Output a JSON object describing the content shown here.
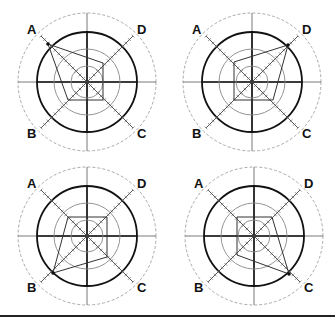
{
  "diagram": {
    "type": "radar-chart-grid",
    "layout": "2x2",
    "axis_labels": [
      "A",
      "D",
      "B",
      "C"
    ],
    "colors": {
      "line": "#111111",
      "ring": "#888888",
      "dashed": "#aaaaaa",
      "polygon": "#333333"
    },
    "panels": [
      {
        "id": "top-left",
        "center": [
          87,
          82
        ],
        "dominant_axis": "A",
        "vertices": {
          "A": [
            48,
            44
          ],
          "D": [
            103,
            63
          ],
          "C": [
            103,
            100
          ],
          "B": [
            68,
            100
          ]
        }
      },
      {
        "id": "top-right",
        "center": [
          252,
          82
        ],
        "dominant_axis": "D",
        "vertices": {
          "A": [
            234,
            62
          ],
          "D": [
            288,
            45
          ],
          "C": [
            273,
            100
          ],
          "B": [
            234,
            100
          ]
        }
      },
      {
        "id": "bottom-left",
        "center": [
          87,
          236
        ],
        "dominant_axis": "B",
        "vertices": {
          "A": [
            68,
            217
          ],
          "D": [
            107,
            217
          ],
          "C": [
            107,
            257
          ],
          "B": [
            53,
            273
          ]
        }
      },
      {
        "id": "bottom-right",
        "center": [
          254,
          236
        ],
        "dominant_axis": "C",
        "vertices": {
          "A": [
            237,
            217
          ],
          "D": [
            272,
            217
          ],
          "C": [
            289,
            274
          ],
          "B": [
            237,
            255
          ]
        }
      }
    ],
    "rings": {
      "inner": 16,
      "middle": 33,
      "bold": 50,
      "outer_dashed": 69
    }
  }
}
